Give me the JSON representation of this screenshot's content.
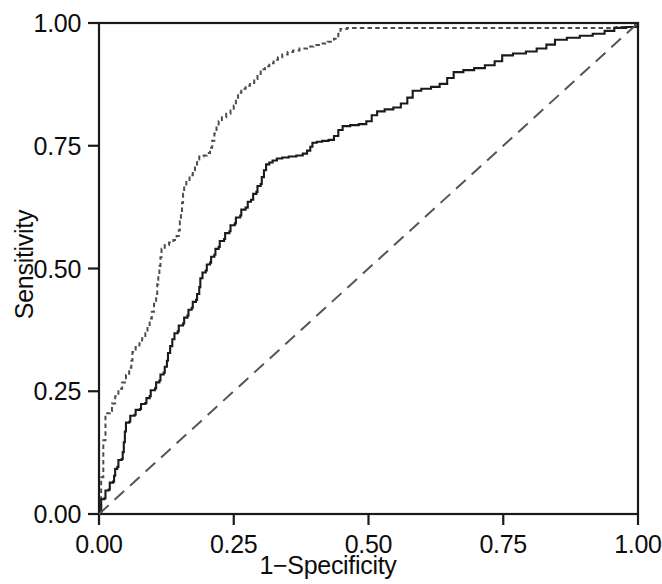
{
  "chart_data": {
    "type": "line",
    "title": "",
    "xlabel": "1−Specificity",
    "ylabel": "Sensitivity",
    "xlim": [
      0,
      1
    ],
    "ylim": [
      0,
      1
    ],
    "xticks": [
      "0.00",
      "0.25",
      "0.50",
      "0.75",
      "1.00"
    ],
    "yticks": [
      "0.00",
      "0.25",
      "0.50",
      "0.75",
      "1.00"
    ],
    "xtick_values": [
      0,
      0.25,
      0.5,
      0.75,
      1
    ],
    "ytick_values": [
      0,
      0.25,
      0.5,
      0.75,
      1
    ],
    "grid": false,
    "legend": "none",
    "series": [
      {
        "name": "roc-curve-dashed",
        "style": "short-dashed",
        "color": "#4d4d4d",
        "points": [
          [
            0.0,
            0.0
          ],
          [
            0.004,
            0.03
          ],
          [
            0.004,
            0.075
          ],
          [
            0.008,
            0.11
          ],
          [
            0.008,
            0.15
          ],
          [
            0.012,
            0.185
          ],
          [
            0.012,
            0.205
          ],
          [
            0.02,
            0.21
          ],
          [
            0.024,
            0.225
          ],
          [
            0.03,
            0.24
          ],
          [
            0.036,
            0.255
          ],
          [
            0.043,
            0.268
          ],
          [
            0.05,
            0.283
          ],
          [
            0.056,
            0.298
          ],
          [
            0.06,
            0.312
          ],
          [
            0.062,
            0.33
          ],
          [
            0.068,
            0.34
          ],
          [
            0.075,
            0.348
          ],
          [
            0.08,
            0.358
          ],
          [
            0.086,
            0.368
          ],
          [
            0.09,
            0.382
          ],
          [
            0.094,
            0.398
          ],
          [
            0.098,
            0.412
          ],
          [
            0.102,
            0.428
          ],
          [
            0.106,
            0.448
          ],
          [
            0.108,
            0.468
          ],
          [
            0.11,
            0.487
          ],
          [
            0.112,
            0.505
          ],
          [
            0.114,
            0.523
          ],
          [
            0.116,
            0.54
          ],
          [
            0.122,
            0.548
          ],
          [
            0.13,
            0.553
          ],
          [
            0.138,
            0.558
          ],
          [
            0.144,
            0.566
          ],
          [
            0.148,
            0.578
          ],
          [
            0.15,
            0.596
          ],
          [
            0.152,
            0.615
          ],
          [
            0.154,
            0.634
          ],
          [
            0.156,
            0.652
          ],
          [
            0.158,
            0.668
          ],
          [
            0.162,
            0.68
          ],
          [
            0.168,
            0.69
          ],
          [
            0.174,
            0.7
          ],
          [
            0.178,
            0.712
          ],
          [
            0.182,
            0.722
          ],
          [
            0.186,
            0.728
          ],
          [
            0.194,
            0.73
          ],
          [
            0.2,
            0.735
          ],
          [
            0.206,
            0.746
          ],
          [
            0.21,
            0.76
          ],
          [
            0.214,
            0.775
          ],
          [
            0.218,
            0.79
          ],
          [
            0.222,
            0.8
          ],
          [
            0.228,
            0.808
          ],
          [
            0.236,
            0.815
          ],
          [
            0.244,
            0.822
          ],
          [
            0.25,
            0.832
          ],
          [
            0.254,
            0.845
          ],
          [
            0.258,
            0.858
          ],
          [
            0.264,
            0.866
          ],
          [
            0.272,
            0.872
          ],
          [
            0.28,
            0.878
          ],
          [
            0.288,
            0.886
          ],
          [
            0.294,
            0.896
          ],
          [
            0.3,
            0.906
          ],
          [
            0.308,
            0.912
          ],
          [
            0.316,
            0.918
          ],
          [
            0.324,
            0.925
          ],
          [
            0.332,
            0.93
          ],
          [
            0.34,
            0.936
          ],
          [
            0.35,
            0.941
          ],
          [
            0.36,
            0.944
          ],
          [
            0.372,
            0.948
          ],
          [
            0.386,
            0.952
          ],
          [
            0.398,
            0.955
          ],
          [
            0.412,
            0.958
          ],
          [
            0.424,
            0.962
          ],
          [
            0.436,
            0.968
          ],
          [
            0.444,
            0.978
          ],
          [
            0.448,
            0.988
          ],
          [
            0.46,
            0.99
          ],
          [
            0.56,
            0.99
          ],
          [
            0.68,
            0.99
          ],
          [
            0.8,
            0.99
          ],
          [
            0.9,
            0.99
          ],
          [
            0.96,
            0.992
          ],
          [
            0.99,
            0.996
          ],
          [
            1.0,
            1.0
          ]
        ]
      },
      {
        "name": "roc-curve-solid",
        "style": "solid",
        "color": "#1a1a1a",
        "points": [
          [
            0.0,
            0.0
          ],
          [
            0.004,
            0.012
          ],
          [
            0.004,
            0.03
          ],
          [
            0.01,
            0.032
          ],
          [
            0.012,
            0.048
          ],
          [
            0.018,
            0.05
          ],
          [
            0.02,
            0.064
          ],
          [
            0.026,
            0.066
          ],
          [
            0.028,
            0.078
          ],
          [
            0.03,
            0.092
          ],
          [
            0.034,
            0.096
          ],
          [
            0.036,
            0.11
          ],
          [
            0.042,
            0.112
          ],
          [
            0.044,
            0.126
          ],
          [
            0.046,
            0.146
          ],
          [
            0.048,
            0.168
          ],
          [
            0.05,
            0.186
          ],
          [
            0.056,
            0.188
          ],
          [
            0.058,
            0.2
          ],
          [
            0.066,
            0.202
          ],
          [
            0.068,
            0.212
          ],
          [
            0.076,
            0.214
          ],
          [
            0.078,
            0.224
          ],
          [
            0.086,
            0.226
          ],
          [
            0.088,
            0.236
          ],
          [
            0.094,
            0.24
          ],
          [
            0.096,
            0.252
          ],
          [
            0.104,
            0.256
          ],
          [
            0.106,
            0.268
          ],
          [
            0.112,
            0.272
          ],
          [
            0.114,
            0.284
          ],
          [
            0.12,
            0.288
          ],
          [
            0.122,
            0.3
          ],
          [
            0.126,
            0.312
          ],
          [
            0.128,
            0.328
          ],
          [
            0.132,
            0.342
          ],
          [
            0.136,
            0.356
          ],
          [
            0.14,
            0.368
          ],
          [
            0.146,
            0.372
          ],
          [
            0.148,
            0.384
          ],
          [
            0.156,
            0.388
          ],
          [
            0.158,
            0.4
          ],
          [
            0.164,
            0.404
          ],
          [
            0.166,
            0.416
          ],
          [
            0.172,
            0.42
          ],
          [
            0.174,
            0.432
          ],
          [
            0.18,
            0.436
          ],
          [
            0.182,
            0.448
          ],
          [
            0.186,
            0.462
          ],
          [
            0.188,
            0.48
          ],
          [
            0.192,
            0.492
          ],
          [
            0.198,
            0.496
          ],
          [
            0.2,
            0.508
          ],
          [
            0.206,
            0.512
          ],
          [
            0.208,
            0.524
          ],
          [
            0.214,
            0.528
          ],
          [
            0.216,
            0.54
          ],
          [
            0.222,
            0.544
          ],
          [
            0.224,
            0.556
          ],
          [
            0.232,
            0.56
          ],
          [
            0.234,
            0.572
          ],
          [
            0.242,
            0.576
          ],
          [
            0.244,
            0.588
          ],
          [
            0.252,
            0.592
          ],
          [
            0.254,
            0.604
          ],
          [
            0.262,
            0.608
          ],
          [
            0.264,
            0.62
          ],
          [
            0.272,
            0.624
          ],
          [
            0.276,
            0.636
          ],
          [
            0.282,
            0.64
          ],
          [
            0.286,
            0.652
          ],
          [
            0.292,
            0.656
          ],
          [
            0.294,
            0.668
          ],
          [
            0.3,
            0.672
          ],
          [
            0.302,
            0.686
          ],
          [
            0.306,
            0.7
          ],
          [
            0.31,
            0.712
          ],
          [
            0.316,
            0.716
          ],
          [
            0.322,
            0.72
          ],
          [
            0.33,
            0.724
          ],
          [
            0.34,
            0.726
          ],
          [
            0.352,
            0.728
          ],
          [
            0.366,
            0.73
          ],
          [
            0.378,
            0.734
          ],
          [
            0.386,
            0.74
          ],
          [
            0.392,
            0.748
          ],
          [
            0.396,
            0.756
          ],
          [
            0.404,
            0.758
          ],
          [
            0.414,
            0.76
          ],
          [
            0.426,
            0.762
          ],
          [
            0.436,
            0.77
          ],
          [
            0.444,
            0.782
          ],
          [
            0.452,
            0.79
          ],
          [
            0.466,
            0.792
          ],
          [
            0.482,
            0.794
          ],
          [
            0.496,
            0.8
          ],
          [
            0.506,
            0.812
          ],
          [
            0.516,
            0.82
          ],
          [
            0.53,
            0.824
          ],
          [
            0.546,
            0.828
          ],
          [
            0.56,
            0.836
          ],
          [
            0.572,
            0.848
          ],
          [
            0.582,
            0.862
          ],
          [
            0.598,
            0.866
          ],
          [
            0.616,
            0.87
          ],
          [
            0.632,
            0.876
          ],
          [
            0.646,
            0.888
          ],
          [
            0.658,
            0.9
          ],
          [
            0.676,
            0.904
          ],
          [
            0.696,
            0.908
          ],
          [
            0.716,
            0.914
          ],
          [
            0.734,
            0.922
          ],
          [
            0.748,
            0.934
          ],
          [
            0.768,
            0.938
          ],
          [
            0.792,
            0.942
          ],
          [
            0.812,
            0.948
          ],
          [
            0.83,
            0.956
          ],
          [
            0.846,
            0.966
          ],
          [
            0.868,
            0.97
          ],
          [
            0.892,
            0.974
          ],
          [
            0.916,
            0.978
          ],
          [
            0.938,
            0.984
          ],
          [
            0.956,
            0.99
          ],
          [
            0.978,
            0.992
          ],
          [
            1.0,
            1.0
          ]
        ]
      },
      {
        "name": "reference-diagonal",
        "style": "long-dashed",
        "color": "#555555",
        "points": [
          [
            0.0,
            0.0
          ],
          [
            1.0,
            1.0
          ]
        ]
      }
    ]
  },
  "axes": {
    "frame_color": "#1a1a1a",
    "tick_color": "#1a1a1a"
  }
}
